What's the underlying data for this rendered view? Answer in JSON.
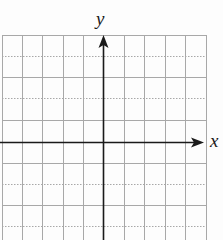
{
  "diagram": {
    "type": "coordinate-plane",
    "x_axis_label": "x",
    "y_axis_label": "y",
    "grid": {
      "columns": 10,
      "rows_visible": 10,
      "cell_size_px": 20.4,
      "line_color": "#a8a8a8",
      "axis_color": "#1a1a1a",
      "alternate_horizontal_lines_dotted": true
    }
  }
}
